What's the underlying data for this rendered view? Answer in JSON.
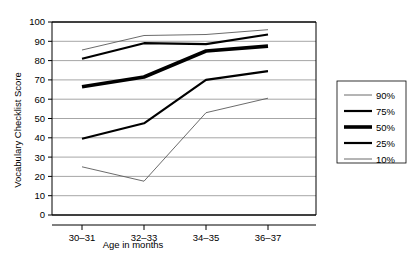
{
  "chart_data": {
    "type": "line",
    "title": "",
    "xlabel": "Age in months",
    "ylabel": "Vocabulary Checklist Score",
    "categories": [
      "30–31",
      "32–33",
      "34–35",
      "36–37"
    ],
    "ylim": [
      0,
      100
    ],
    "ytick_labels": [
      "0",
      "10",
      "20",
      "30",
      "40",
      "50",
      "60",
      "70",
      "80",
      "90",
      "100"
    ],
    "yticks": [
      0,
      10,
      20,
      30,
      40,
      50,
      60,
      70,
      80,
      90,
      100
    ],
    "grid": "horizontal",
    "legend_position": "right",
    "series": [
      {
        "name": "90%",
        "values": [
          85.5,
          93.0,
          93.5,
          96.0
        ],
        "stroke_width": 0.9,
        "color": "#5a5a5a"
      },
      {
        "name": "75%",
        "values": [
          81.0,
          89.0,
          88.5,
          93.5
        ],
        "stroke_width": 2.2,
        "color": "#000000"
      },
      {
        "name": "50%",
        "values": [
          66.5,
          71.5,
          85.0,
          87.5
        ],
        "stroke_width": 3.6,
        "color": "#000000"
      },
      {
        "name": "25%",
        "values": [
          39.5,
          47.5,
          70.0,
          74.5
        ],
        "stroke_width": 2.2,
        "color": "#000000"
      },
      {
        "name": "10%",
        "values": [
          25.0,
          17.5,
          53.0,
          60.5
        ],
        "stroke_width": 0.9,
        "color": "#5a5a5a"
      }
    ]
  },
  "legend": {
    "items": [
      {
        "label": "90%"
      },
      {
        "label": "75%"
      },
      {
        "label": "50%"
      },
      {
        "label": "25%"
      },
      {
        "label": "10%"
      }
    ]
  }
}
